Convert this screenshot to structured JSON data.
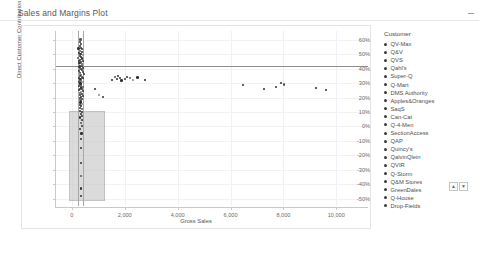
{
  "header": {
    "title": "Sales and Margins Plot",
    "collapse_icon": "collapse-dash-icon"
  },
  "legend": {
    "title": "Customer",
    "items": [
      {
        "label": "QV-Max"
      },
      {
        "label": "Q&V"
      },
      {
        "label": "QVS"
      },
      {
        "label": "Qahl's"
      },
      {
        "label": "Super-Q"
      },
      {
        "label": "Q-Mart"
      },
      {
        "label": "DMS Authority"
      },
      {
        "label": "Apples&Oranges"
      },
      {
        "label": "SaqS"
      },
      {
        "label": "Can-Cat"
      },
      {
        "label": "Q-4-Men"
      },
      {
        "label": "SectionAccess"
      },
      {
        "label": "QAP"
      },
      {
        "label": "Quincy's"
      },
      {
        "label": "QalvinQlein"
      },
      {
        "label": "QVIR"
      },
      {
        "label": "Q-Storm"
      },
      {
        "label": "Q&M Stores"
      },
      {
        "label": "GreenDales"
      },
      {
        "label": "Q-House"
      },
      {
        "label": "Drop-Fields"
      }
    ],
    "scroll_up": "▲",
    "scroll_down": "▼"
  },
  "chart_data": {
    "type": "scatter",
    "title": "Sales and Margins Plot",
    "xlabel": "Gross Sales",
    "ylabel": "Direct Customer Contribution Margin %",
    "xlim": [
      -600,
      11200
    ],
    "ylim": [
      -0.55,
      0.66
    ],
    "xticks": [
      0,
      2000,
      4000,
      6000,
      8000,
      10000
    ],
    "xticklabels": [
      "0",
      "2,000",
      "4,000",
      "6,000",
      "8,000",
      "10,000"
    ],
    "yticks": [
      0.6,
      0.5,
      0.4,
      0.3,
      0.2,
      0.1,
      0,
      -0.1,
      -0.2,
      -0.3,
      -0.4,
      -0.5
    ],
    "yticklabels": [
      "60%",
      "50%",
      "40%",
      "30%",
      "20%",
      "10%",
      "0%",
      "-10%",
      "-20%",
      "-30%",
      "-40%",
      "-50%"
    ],
    "grid": true,
    "legend_position": "right",
    "reference_lines": [
      {
        "orientation": "horizontal",
        "value": 0.42,
        "color": "#8e8e8e"
      },
      {
        "orientation": "vertical",
        "value": 240,
        "color": "#a8a8a8"
      },
      {
        "orientation": "vertical",
        "value": 430,
        "color": "#a8a8a8"
      }
    ],
    "highlight_region": {
      "x0": -120,
      "x1": 1180,
      "y0": -0.5,
      "y1": 0.105,
      "fill": "#c6c6c6",
      "stroke": "#9e9e9e"
    },
    "series": [
      {
        "name": "Customer",
        "color": "#2f2f2f",
        "points": [
          [
            330,
            0.6
          ],
          [
            300,
            0.584
          ],
          [
            360,
            0.57
          ],
          [
            290,
            0.556
          ],
          [
            340,
            0.545
          ],
          [
            255,
            0.54
          ],
          [
            400,
            0.533
          ],
          [
            310,
            0.524
          ],
          [
            370,
            0.515
          ],
          [
            270,
            0.508
          ],
          [
            330,
            0.5
          ],
          [
            420,
            0.494
          ],
          [
            295,
            0.487
          ],
          [
            350,
            0.48
          ],
          [
            250,
            0.474
          ],
          [
            385,
            0.468
          ],
          [
            315,
            0.462
          ],
          [
            275,
            0.455
          ],
          [
            430,
            0.45
          ],
          [
            340,
            0.444
          ],
          [
            300,
            0.438
          ],
          [
            365,
            0.432
          ],
          [
            260,
            0.427
          ],
          [
            395,
            0.421
          ],
          [
            320,
            0.416
          ],
          [
            285,
            0.41
          ],
          [
            440,
            0.405
          ],
          [
            345,
            0.4
          ],
          [
            305,
            0.394
          ],
          [
            375,
            0.389
          ],
          [
            265,
            0.383
          ],
          [
            405,
            0.378
          ],
          [
            325,
            0.372
          ],
          [
            290,
            0.366
          ],
          [
            450,
            0.361
          ],
          [
            350,
            0.355
          ],
          [
            310,
            0.349
          ],
          [
            380,
            0.344
          ],
          [
            270,
            0.338
          ],
          [
            410,
            0.332
          ],
          [
            330,
            0.327
          ],
          [
            295,
            0.321
          ],
          [
            355,
            0.315
          ],
          [
            275,
            0.309
          ],
          [
            415,
            0.304
          ],
          [
            335,
            0.298
          ],
          [
            300,
            0.292
          ],
          [
            360,
            0.286
          ],
          [
            280,
            0.28
          ],
          [
            420,
            0.274
          ],
          [
            340,
            0.268
          ],
          [
            305,
            0.262
          ],
          [
            365,
            0.256
          ],
          [
            285,
            0.249
          ],
          [
            425,
            0.243
          ],
          [
            345,
            0.237
          ],
          [
            310,
            0.23
          ],
          [
            370,
            0.224
          ],
          [
            290,
            0.217
          ],
          [
            430,
            0.21
          ],
          [
            350,
            0.203
          ],
          [
            315,
            0.196
          ],
          [
            375,
            0.189
          ],
          [
            295,
            0.181
          ],
          [
            355,
            0.173
          ],
          [
            320,
            0.165
          ],
          [
            380,
            0.157
          ],
          [
            300,
            0.148
          ],
          [
            360,
            0.139
          ],
          [
            325,
            0.13
          ],
          [
            385,
            0.12
          ],
          [
            305,
            0.11
          ],
          [
            365,
            0.099
          ],
          [
            330,
            0.087
          ],
          [
            390,
            0.074
          ],
          [
            310,
            0.06
          ],
          [
            370,
            0.044
          ],
          [
            335,
            0.026
          ],
          [
            395,
            0.005
          ],
          [
            315,
            -0.02
          ],
          [
            375,
            -0.05
          ],
          [
            340,
            -0.09
          ],
          [
            360,
            -0.15
          ],
          [
            350,
            -0.25
          ],
          [
            355,
            -0.34
          ],
          [
            345,
            -0.43
          ],
          [
            330,
            -0.48
          ],
          [
            880,
            0.26
          ],
          [
            1020,
            0.22
          ],
          [
            1180,
            0.205
          ],
          [
            1520,
            0.32
          ],
          [
            1620,
            0.345
          ],
          [
            1700,
            0.33
          ],
          [
            1760,
            0.352
          ],
          [
            1820,
            0.336
          ],
          [
            1880,
            0.318
          ],
          [
            2020,
            0.33
          ],
          [
            2100,
            0.345
          ],
          [
            2180,
            0.338
          ],
          [
            2320,
            0.322
          ],
          [
            2480,
            0.34
          ],
          [
            6480,
            0.29
          ],
          [
            7280,
            0.258
          ],
          [
            7720,
            0.272
          ],
          [
            7900,
            0.3
          ],
          [
            8020,
            0.292
          ],
          [
            9220,
            0.268
          ],
          [
            9620,
            0.252
          ],
          [
            2780,
            0.318
          ]
        ]
      }
    ]
  }
}
